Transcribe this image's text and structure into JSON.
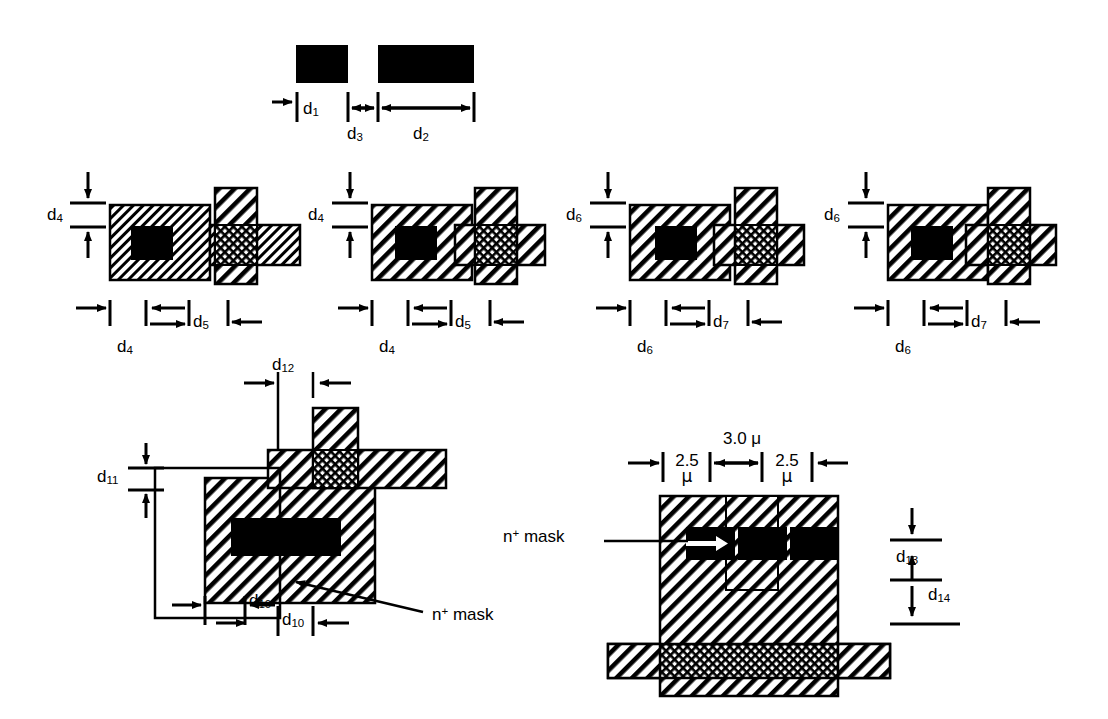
{
  "figure": {
    "kind": "semiconductor-layout-dimension-figure",
    "background": "#ffffff",
    "ink": "#000000"
  },
  "labels": {
    "d1": "d",
    "d1s": "1",
    "d2": "d",
    "d2s": "2",
    "d3": "d",
    "d3s": "3",
    "d4": "d",
    "d4s": "4",
    "d5": "d",
    "d5s": "5",
    "d6": "d",
    "d6s": "6",
    "d7": "d",
    "d7s": "7",
    "d10": "d",
    "d10s": "10",
    "d11": "d",
    "d11s": "11",
    "d12": "d",
    "d12s": "12",
    "d13": "d",
    "d13s": "13",
    "d14": "d",
    "d14s": "14"
  },
  "panels": {
    "top": {
      "name": "contact-spacing-panel",
      "dims": [
        "d1",
        "d3",
        "d2"
      ]
    },
    "row2": [
      {
        "name": "panel-a",
        "vertical_dim": "d4",
        "bottom_dims": [
          "d4",
          "d5"
        ]
      },
      {
        "name": "panel-b",
        "vertical_dim": "d4",
        "bottom_dims": [
          "d4",
          "d5"
        ]
      },
      {
        "name": "panel-c",
        "vertical_dim": "d6",
        "bottom_dims": [
          "d6",
          "d7"
        ]
      },
      {
        "name": "panel-d",
        "vertical_dim": "d6",
        "bottom_dims": [
          "d6",
          "d7"
        ]
      }
    ],
    "bottom_left": {
      "name": "nplus-mask-overlap-panel",
      "top_dim": "d12",
      "left_dim": "d11",
      "bottom_dims": [
        "d10",
        "d10"
      ],
      "callout": {
        "n": "n",
        "plus": "+",
        "mask": "mask"
      }
    },
    "bottom_right": {
      "name": "nplus-mask-cross-section-panel",
      "top_total": "3.0 μ",
      "top_left_value": "2.5",
      "top_left_unit": "μ",
      "top_right_value": "2.5",
      "top_right_unit": "μ",
      "right_dims": [
        "d13",
        "d14"
      ],
      "callout": {
        "n": "n",
        "plus": "+",
        "mask": "mask"
      }
    }
  }
}
